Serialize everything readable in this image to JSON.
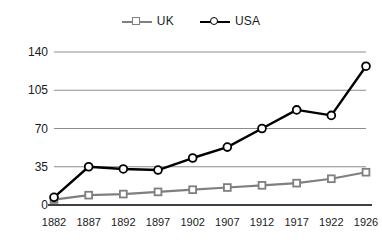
{
  "chart_data": {
    "type": "line",
    "title": "",
    "subtitle": "",
    "xlabel": "",
    "ylabel": "",
    "x": [
      1882,
      1887,
      1892,
      1897,
      1902,
      1907,
      1912,
      1917,
      1922,
      1926
    ],
    "categories": [
      "1882",
      "1887",
      "1892",
      "1897",
      "1902",
      "1907",
      "1912",
      "1917",
      "1922",
      "1926"
    ],
    "series": [
      {
        "name": "UK",
        "color": "#7f7f7f",
        "marker": "square",
        "values": [
          5,
          9,
          10,
          12,
          14,
          16,
          18,
          20,
          24,
          30
        ]
      },
      {
        "name": "USA",
        "color": "#000000",
        "marker": "circle",
        "values": [
          7,
          35,
          33,
          32,
          43,
          53,
          70,
          87,
          82,
          127
        ]
      }
    ],
    "yticks": [
      0,
      35,
      70,
      105,
      140
    ],
    "ytick_labels": [
      "0",
      "35",
      "70",
      "105",
      "140"
    ],
    "ylim": [
      0,
      140
    ],
    "grid": true,
    "grid_axis": "y",
    "legend": {
      "position": "top-center",
      "orientation": "horizontal",
      "entries": [
        {
          "label": "UK",
          "color": "#7f7f7f",
          "marker": "square"
        },
        {
          "label": "USA",
          "color": "#000000",
          "marker": "circle"
        }
      ]
    },
    "axis_color": "#000000",
    "grid_color": "#8c8c8c",
    "background": "#ffffff"
  }
}
